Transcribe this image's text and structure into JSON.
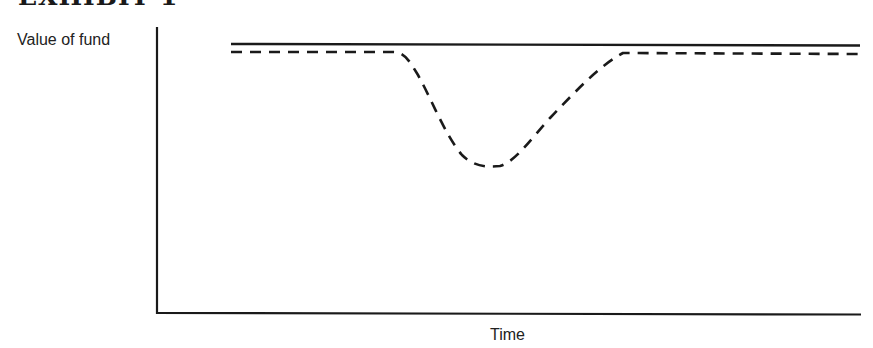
{
  "title": "EXHIBIT 1",
  "chart_data": {
    "type": "line",
    "title": "EXHIBIT 1",
    "xlabel": "Time",
    "ylabel": "Value of fund",
    "grid": false,
    "legend": null,
    "ticks": {
      "x": [],
      "y": []
    },
    "axis_ranges": {
      "x": [
        0,
        100
      ],
      "y": [
        0,
        100
      ]
    },
    "series": [
      {
        "name": "solid-line",
        "style": "solid",
        "description": "Constant value over time",
        "x": [
          0,
          100
        ],
        "y": [
          94,
          94
        ]
      },
      {
        "name": "dashed-line",
        "style": "dashed",
        "description": "Equal level, then a temporary dip and recovery",
        "x": [
          0,
          23,
          29,
          38,
          44,
          52,
          62,
          100
        ],
        "y": [
          91,
          91,
          85,
          55,
          51,
          65,
          91,
          91
        ]
      }
    ],
    "colors": {
      "lines": "#1a1a1a",
      "axes": "#1a1a1a",
      "background": "#ffffff"
    }
  }
}
